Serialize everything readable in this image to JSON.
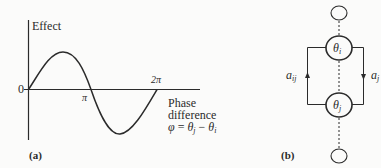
{
  "panel_a": {
    "label": "(a)",
    "y_axis_label": "Effect",
    "origin_label": "0",
    "x_ticks": {
      "pi": "π",
      "two_pi": "2π"
    },
    "x_axis_label_line1": "Phase",
    "x_axis_label_line2": "difference",
    "x_axis_formula": {
      "phi": "φ",
      "eq": " = ",
      "theta1": "θ",
      "sub1": "j",
      "minus": " − ",
      "theta2": "θ",
      "sub2": "i"
    },
    "curve": "sine-like effect vs phase difference, positive on (0, π), negative on (π, 2π)"
  },
  "panel_b": {
    "label": "(b)",
    "node_top": {
      "theta": "θ",
      "sub": "i"
    },
    "node_bottom": {
      "theta": "θ",
      "sub": "j"
    },
    "left_edge": {
      "a": "a",
      "sub": "ij",
      "direction": "up"
    },
    "right_edge": {
      "a": "a",
      "sub": "j",
      "direction": "down"
    }
  },
  "colors": {
    "ink": "#2b2b2b",
    "background": "#fbfbfa"
  }
}
